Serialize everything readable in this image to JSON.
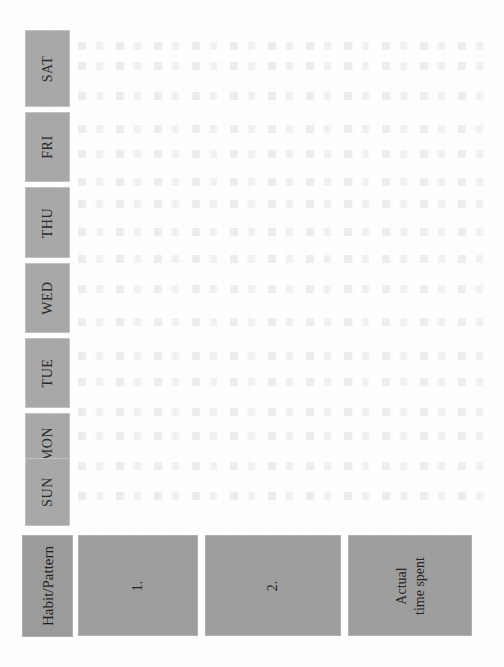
{
  "document": {
    "type": "habit-pattern-weekly-tracker",
    "orientation_note": "scanned landscape table on a portrait page; all cell text is rotated 90 degrees counter-clockwise",
    "paper_color": "#fefefe"
  },
  "colors": {
    "day_header_fill": "#a8a8a8",
    "corner_header_fill": "#9b9b9b",
    "entry_cell_fill": "#9e9e9e",
    "text": "#232323"
  },
  "table": {
    "corner_header": {
      "label": "Habit/Pattern"
    },
    "day_headers": [
      {
        "label": "SAT",
        "top": 30,
        "height": 77
      },
      {
        "label": "FRI",
        "top": 112,
        "height": 70
      },
      {
        "label": "THU",
        "top": 187,
        "height": 71
      },
      {
        "label": "WED",
        "top": 263,
        "height": 70
      },
      {
        "label": "TUE",
        "top": 338,
        "height": 70
      },
      {
        "label": "MON",
        "top": 413,
        "height": 62
      },
      {
        "label": "SUN",
        "top": 458,
        "height": 68
      }
    ],
    "entry_cells": [
      {
        "label_lines": [
          "1."
        ],
        "left": 78,
        "width": 120
      },
      {
        "label_lines": [
          "2."
        ],
        "left": 205,
        "width": 136
      },
      {
        "label_lines": [
          "Actual",
          "time spent"
        ],
        "left": 348,
        "width": 124
      }
    ],
    "grid_body_note": "open, unfilled writing area — no entries recorded"
  }
}
